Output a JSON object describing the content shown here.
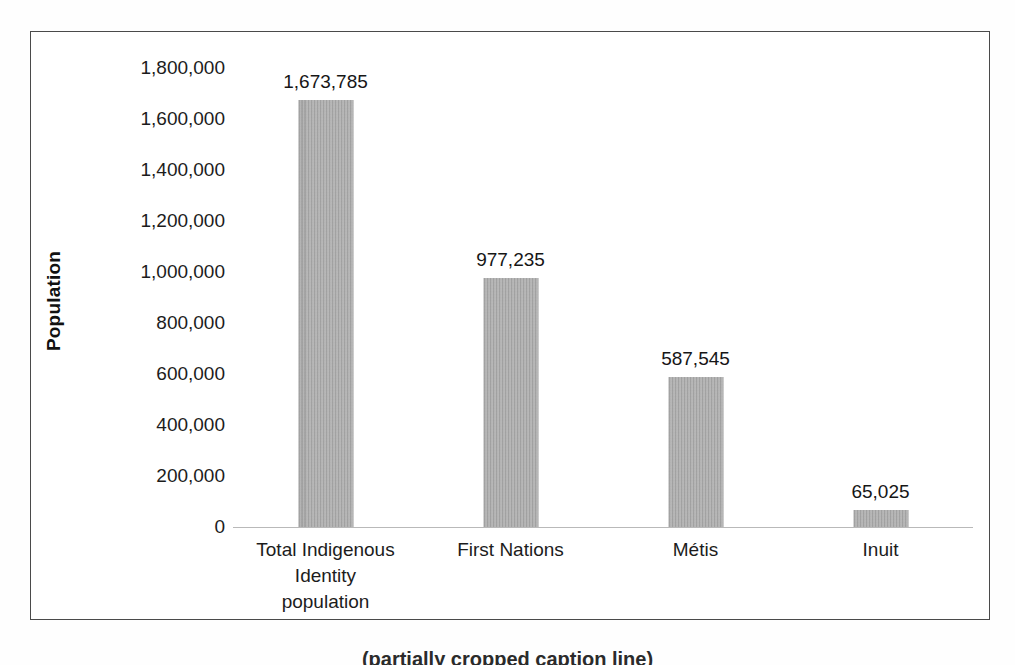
{
  "chart_data": {
    "type": "bar",
    "title": "",
    "subtitle": "",
    "xlabel": "",
    "ylabel": "Population",
    "categories": [
      "Total Indigenous Identity population",
      "First Nations",
      "Métis",
      "Inuit"
    ],
    "category_lines": [
      [
        "Total Indigenous",
        "Identity",
        "population"
      ],
      [
        "First Nations"
      ],
      [
        "Métis"
      ],
      [
        "Inuit"
      ]
    ],
    "values": [
      1673785,
      977235,
      587545,
      65025
    ],
    "value_labels": [
      "1,673,785",
      "977,235",
      "587,545",
      "65,025"
    ],
    "ylim": [
      0,
      1800000
    ],
    "ytick_values": [
      1800000,
      1600000,
      1400000,
      1200000,
      1000000,
      800000,
      600000,
      400000,
      200000,
      0
    ],
    "ytick_labels": [
      "1,800,000",
      "1,600,000",
      "1,400,000",
      "1,200,000",
      "1,000,000",
      "800,000",
      "600,000",
      "400,000",
      "200,000",
      "0"
    ],
    "grid": false,
    "legend": false,
    "legend_position": "none",
    "bar_color": "#a9a9a9",
    "axis_color": "#b9b9b9",
    "text_color": "#1c1c1c",
    "frame_color": "#4a4a4a"
  },
  "caption": {
    "text": "(partially cropped caption line)"
  }
}
